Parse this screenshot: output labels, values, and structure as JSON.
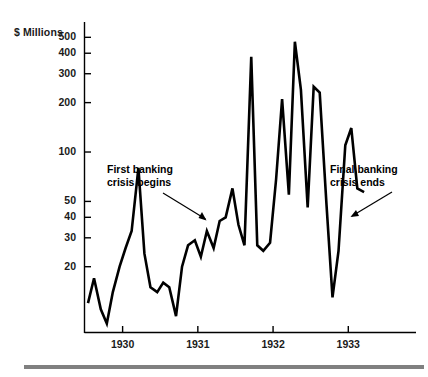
{
  "figure": {
    "background_color": "#ffffff",
    "ink_color": "#000000",
    "rule_color": "#808080",
    "width": 428,
    "height": 377
  },
  "axes": {
    "y_axis_title": "$ Millions",
    "y_tick_labels": [
      "500",
      "400",
      "300",
      "200",
      "100",
      "50",
      "40",
      "30",
      "20"
    ],
    "x_tick_labels": [
      "1930",
      "1931",
      "1932",
      "1933"
    ]
  },
  "annotations": [
    {
      "name": "first-banking-crisis",
      "line1": "First banking",
      "line2": "crisis begins"
    },
    {
      "name": "final-banking-crisis",
      "line1": "Final banking",
      "line2": "crisis ends"
    }
  ],
  "chart_data": {
    "type": "line",
    "title": "",
    "subtitle": "",
    "xlabel": "",
    "ylabel": "$ Millions",
    "yscale": "log",
    "ylim": [
      8,
      620
    ],
    "xlim": [
      1929.5,
      1933.9
    ],
    "grid": false,
    "legend": null,
    "yticks": [
      20,
      30,
      40,
      50,
      100,
      200,
      300,
      400,
      500
    ],
    "ytick_labels": [
      "20",
      "30",
      "40",
      "50",
      "100",
      "200",
      "300",
      "400",
      "500"
    ],
    "xticks": [
      1930,
      1931,
      1932,
      1933
    ],
    "xtick_labels": [
      "1930",
      "1931",
      "1932",
      "1933"
    ],
    "series": [
      {
        "name": "Deposits of suspended banks",
        "color": "#000000",
        "x": [
          1929.54,
          1929.62,
          1929.71,
          1929.79,
          1929.87,
          1929.96,
          1930.04,
          1930.12,
          1930.21,
          1930.29,
          1930.37,
          1930.46,
          1930.54,
          1930.62,
          1930.71,
          1930.79,
          1930.87,
          1930.96,
          1931.04,
          1931.12,
          1931.21,
          1931.29,
          1931.37,
          1931.46,
          1931.54,
          1931.62,
          1931.71,
          1931.79,
          1931.87,
          1931.96,
          1932.04,
          1932.12,
          1932.21,
          1932.29,
          1932.37,
          1932.46,
          1932.54,
          1932.62,
          1932.71,
          1932.79,
          1932.87,
          1932.96,
          1933.04,
          1933.12,
          1933.21
        ],
        "y": [
          12,
          17,
          11,
          9,
          14,
          20,
          26,
          33,
          80,
          24,
          15,
          14,
          16,
          15,
          10,
          20,
          27,
          29,
          23,
          33,
          26,
          38,
          40,
          60,
          36,
          27,
          380,
          27,
          25,
          28,
          68,
          210,
          55,
          470,
          240,
          46,
          250,
          230,
          48,
          13,
          25,
          110,
          140,
          60,
          57
        ]
      }
    ],
    "annotations": [
      {
        "text": "First banking crisis begins",
        "target_x": 1930.96,
        "target_y": 29,
        "label_x": 1930.3,
        "label_y": 110
      },
      {
        "text": "Final banking crisis ends",
        "target_x": 1933.18,
        "target_y": 57,
        "label_x": 1933.4,
        "label_y": 115
      }
    ]
  }
}
